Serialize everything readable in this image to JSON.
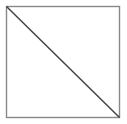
{
  "figure": {
    "name": "square-with-diagonal",
    "background_color": "#ffffff",
    "canvas": {
      "width": 127,
      "height": 124
    },
    "square": {
      "name": "square-outline",
      "x": 6.5,
      "y": 6.5,
      "width": 113,
      "height": 111,
      "stroke_color": "#888888",
      "stroke_width": 1.4,
      "fill": "none"
    },
    "diagonal": {
      "name": "diagonal-line",
      "x1": 7,
      "y1": 7,
      "x2": 119,
      "y2": 117,
      "stroke_color": "#444444",
      "stroke_width": 1.5,
      "direction": "top-left-to-bottom-right"
    },
    "regions": [
      {
        "name": "upper-right-triangle",
        "fill": "#ffffff",
        "label": ""
      },
      {
        "name": "lower-left-triangle",
        "fill": "#ffffff",
        "label": ""
      }
    ]
  }
}
